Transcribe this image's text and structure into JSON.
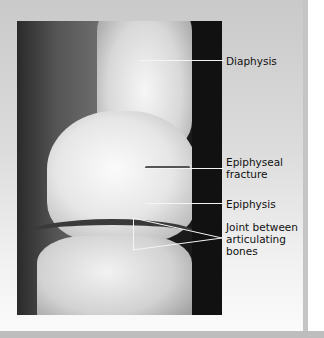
{
  "figure": {
    "labels": {
      "diaphysis": "Diaphysis",
      "epiphyseal_fracture_1": "Epiphyseal",
      "epiphyseal_fracture_2": "fracture",
      "epiphysis": "Epiphysis",
      "joint_1": "Joint between",
      "joint_2": "articulating",
      "joint_3": "bones"
    }
  }
}
